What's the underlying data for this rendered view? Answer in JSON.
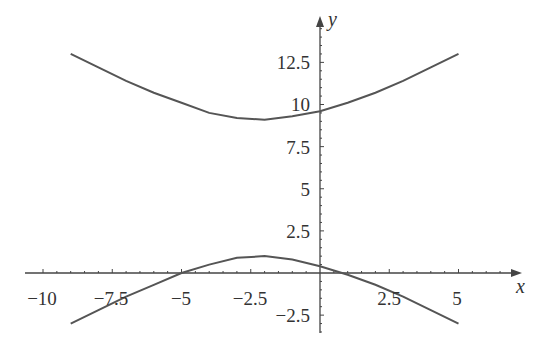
{
  "chart_data": {
    "type": "line",
    "title": "",
    "xlabel": "x",
    "ylabel": "y",
    "xlim": [
      -10.5,
      7
    ],
    "ylim": [
      -3.5,
      15
    ],
    "grid": false,
    "x_ticks": [
      "-10",
      "-7.5",
      "-5",
      "-2.5",
      "2.5",
      "5"
    ],
    "y_ticks": [
      "12.5",
      "10",
      "7.5",
      "5",
      "2.5",
      "-2.5"
    ],
    "series": [
      {
        "name": "upper branch",
        "x": [
          -9,
          -8,
          -7,
          -6,
          -5,
          -4,
          -3,
          -2,
          -1,
          0,
          1,
          2,
          3,
          4,
          5
        ],
        "values": [
          13,
          12.2,
          11.4,
          10.7,
          10.1,
          9.5,
          9.2,
          9.1,
          9.3,
          9.6,
          10.1,
          10.7,
          11.4,
          12.2,
          13
        ]
      },
      {
        "name": "lower branch",
        "x": [
          -9,
          -8,
          -7,
          -6,
          -5,
          -4,
          -3,
          -2,
          -1,
          0,
          1,
          2,
          3,
          4,
          5
        ],
        "values": [
          -3,
          -2.2,
          -1.4,
          -0.7,
          0,
          0.5,
          0.9,
          1,
          0.8,
          0.4,
          -0.1,
          -0.7,
          -1.4,
          -2.2,
          -3
        ]
      }
    ]
  },
  "axes": {
    "x_label": "x",
    "y_label": "y",
    "x_tick_labels": [
      "−10",
      "−7.5",
      "−5",
      "−2.5",
      "2.5",
      "5"
    ],
    "y_tick_labels": [
      "12.5",
      "10",
      "7.5",
      "5",
      "2.5",
      "−2.5"
    ]
  }
}
